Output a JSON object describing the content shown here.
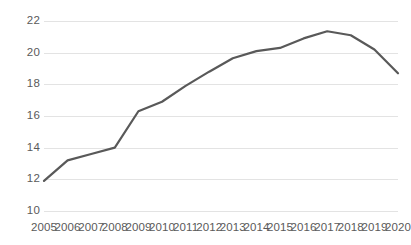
{
  "chart_data": {
    "type": "line",
    "title": "",
    "subtitle": "",
    "xlabel": "",
    "ylabel": "",
    "categories": [
      "2005",
      "2006",
      "2007",
      "2008",
      "2009",
      "2010",
      "2011",
      "2012",
      "2013",
      "2014",
      "2015",
      "2016",
      "2017",
      "2018",
      "2019",
      "2020"
    ],
    "values": [
      11.9,
      13.2,
      13.6,
      14.0,
      16.3,
      16.9,
      17.9,
      18.8,
      19.65,
      20.1,
      20.3,
      20.9,
      21.35,
      21.1,
      20.2,
      18.7
    ],
    "series": [
      {
        "name": "",
        "values": [
          11.9,
          13.2,
          13.6,
          14.0,
          16.3,
          16.9,
          17.9,
          18.8,
          19.65,
          20.1,
          20.3,
          20.9,
          21.35,
          21.1,
          20.2,
          18.7
        ]
      }
    ],
    "ylim": [
      10,
      22
    ],
    "yticks": [
      10,
      12,
      14,
      16,
      18,
      20,
      22
    ],
    "ytick_labels": [
      "10",
      "12",
      "14",
      "16",
      "18",
      "20",
      "22"
    ],
    "xtick_labels": [
      "2005",
      "2006",
      "2007",
      "2008",
      "2009",
      "2010",
      "2011",
      "2012",
      "2013",
      "2014",
      "2015",
      "2016",
      "2017",
      "2018",
      "2019",
      "2020"
    ],
    "grid": "horizontal",
    "legend": "none",
    "markers": false,
    "line_color": "#595959",
    "gridline_color": "#e3e3e3",
    "background_color": "#ffffff",
    "axis_text_color": "#5a5a5a"
  }
}
